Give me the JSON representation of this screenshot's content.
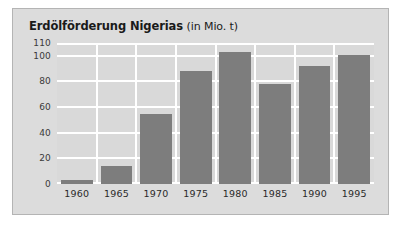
{
  "card": {
    "background_color": "#dcdcdc",
    "border_color": "#b4b4b4"
  },
  "title": {
    "main": "Erdölförderung Nigerias",
    "unit": "(in Mio. t)",
    "full": "Erdölförderung Nigerias (in Mio. t)"
  },
  "colors": {
    "bar": "#7d7d7d",
    "plot_background": "#d9d9d9",
    "gridline": "#ffffff",
    "text": "#1a1a1a"
  },
  "chart_data": {
    "type": "bar",
    "title": "Erdölförderung Nigerias (in Mio. t)",
    "xlabel": "",
    "ylabel": "",
    "unit": "Mio. t",
    "categories": [
      "1960",
      "1965",
      "1970",
      "1975",
      "1980",
      "1985",
      "1990",
      "1995"
    ],
    "values": [
      3,
      14,
      55,
      88,
      103,
      78,
      92,
      101
    ],
    "ylim": [
      0,
      110
    ],
    "yticks": [
      0,
      20,
      40,
      60,
      80,
      100,
      110
    ],
    "ytick_labels": [
      "0",
      "20",
      "40",
      "60",
      "80",
      "100",
      "110"
    ],
    "grid": true,
    "legend": false,
    "legend_position": "none",
    "series": [
      {
        "name": "Erdölförderung",
        "values": [
          3,
          14,
          55,
          88,
          103,
          78,
          92,
          101
        ]
      }
    ]
  }
}
